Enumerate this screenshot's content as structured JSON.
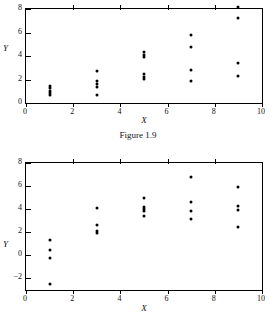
{
  "caption": "Figure 1.9",
  "chart_data": [
    {
      "id": "top",
      "type": "scatter",
      "title": "",
      "xlabel": "X",
      "ylabel": "Y",
      "xlim": [
        0,
        10
      ],
      "ylim": [
        0,
        8
      ],
      "xticks": [
        0,
        2,
        4,
        6,
        8,
        10
      ],
      "yticks": [
        0,
        2,
        4,
        6,
        8
      ],
      "xtick_labels": [
        "0",
        "2",
        "4",
        "6",
        "8",
        "10"
      ],
      "ytick_labels": [
        "0",
        "2",
        "4",
        "6",
        "8"
      ],
      "grid": false,
      "legend": "none",
      "marker": "filled-circle",
      "marker_color": "#000000",
      "points": [
        {
          "x": 1,
          "y": 1.45
        },
        {
          "x": 1,
          "y": 1.25
        },
        {
          "x": 1,
          "y": 1.05
        },
        {
          "x": 1,
          "y": 0.85
        },
        {
          "x": 1,
          "y": 0.7
        },
        {
          "x": 3,
          "y": 2.7
        },
        {
          "x": 3,
          "y": 1.85
        },
        {
          "x": 3,
          "y": 1.6
        },
        {
          "x": 3,
          "y": 1.4
        },
        {
          "x": 3,
          "y": 0.7
        },
        {
          "x": 5,
          "y": 4.35
        },
        {
          "x": 5,
          "y": 4.1
        },
        {
          "x": 5,
          "y": 3.95
        },
        {
          "x": 5,
          "y": 2.5
        },
        {
          "x": 5,
          "y": 2.25
        },
        {
          "x": 5,
          "y": 2.05
        },
        {
          "x": 7,
          "y": 5.8
        },
        {
          "x": 7,
          "y": 4.75
        },
        {
          "x": 7,
          "y": 2.85
        },
        {
          "x": 7,
          "y": 1.9
        },
        {
          "x": 9,
          "y": 8.15
        },
        {
          "x": 9,
          "y": 7.2
        },
        {
          "x": 9,
          "y": 3.4
        },
        {
          "x": 9,
          "y": 2.3
        }
      ]
    },
    {
      "id": "bottom",
      "type": "scatter",
      "title": "",
      "xlabel": "X",
      "ylabel": "Y",
      "xlim": [
        0,
        10
      ],
      "ylim": [
        -3,
        8
      ],
      "xticks": [
        0,
        2,
        4,
        6,
        8,
        10
      ],
      "yticks": [
        -2,
        0,
        2,
        4,
        6,
        8
      ],
      "xtick_labels": [
        "0",
        "2",
        "4",
        "6",
        "8",
        "10"
      ],
      "ytick_labels": [
        "−2",
        "0",
        "2",
        "4",
        "6",
        "8"
      ],
      "grid": false,
      "legend": "none",
      "marker": "filled-circle",
      "marker_color": "#000000",
      "points": [
        {
          "x": 1,
          "y": 1.3
        },
        {
          "x": 1,
          "y": 0.5
        },
        {
          "x": 1,
          "y": -0.25
        },
        {
          "x": 1,
          "y": -2.5
        },
        {
          "x": 3,
          "y": 4.1
        },
        {
          "x": 3,
          "y": 2.6
        },
        {
          "x": 3,
          "y": 2.1
        },
        {
          "x": 3,
          "y": 1.9
        },
        {
          "x": 5,
          "y": 4.95
        },
        {
          "x": 5,
          "y": 4.2
        },
        {
          "x": 5,
          "y": 4.0
        },
        {
          "x": 5,
          "y": 3.85
        },
        {
          "x": 5,
          "y": 3.45
        },
        {
          "x": 7,
          "y": 6.8
        },
        {
          "x": 7,
          "y": 4.65
        },
        {
          "x": 7,
          "y": 3.85
        },
        {
          "x": 7,
          "y": 3.15
        },
        {
          "x": 9,
          "y": 5.9
        },
        {
          "x": 9,
          "y": 4.25
        },
        {
          "x": 9,
          "y": 3.95
        },
        {
          "x": 9,
          "y": 2.45
        }
      ]
    }
  ]
}
